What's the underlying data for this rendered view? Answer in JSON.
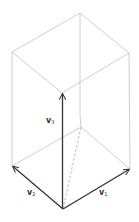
{
  "diagram": {
    "type": "parallelepiped-vectors",
    "colors": {
      "vector": "#333333",
      "edge": "#c8c8c8",
      "hidden_edge": "#a8a8a8",
      "background": "#ffffff"
    },
    "vertices": {
      "origin": [
        63,
        209
      ],
      "v1_tip": [
        130,
        169
      ],
      "v2_tip": [
        12,
        166
      ],
      "v3_tip": [
        62,
        93
      ],
      "bottom_back": [
        81,
        127
      ],
      "top_left": [
        12,
        52
      ],
      "top_right": [
        129,
        53
      ],
      "top_back": [
        80,
        13
      ]
    },
    "vectors": [
      {
        "id": "v1",
        "label": "v",
        "subscript": "1",
        "from": "origin",
        "to": "v1_tip"
      },
      {
        "id": "v2",
        "label": "v",
        "subscript": "2",
        "from": "origin",
        "to": "v2_tip"
      },
      {
        "id": "v3",
        "label": "v",
        "subscript": "3",
        "from": "origin",
        "to": "v3_tip"
      }
    ],
    "labels": {
      "v1": {
        "main": "v",
        "sub": "1"
      },
      "v2": {
        "main": "v",
        "sub": "2"
      },
      "v3": {
        "main": "v",
        "sub": "3"
      }
    }
  }
}
